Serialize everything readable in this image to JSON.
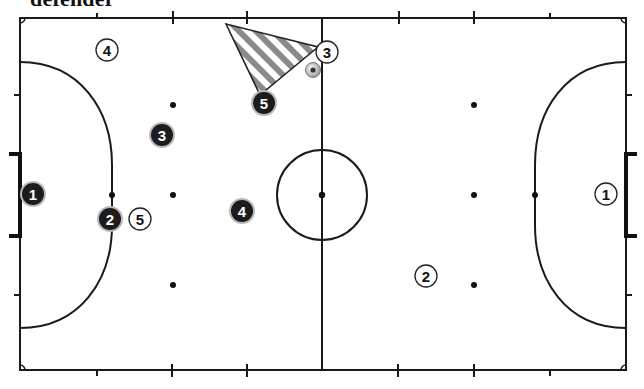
{
  "caption": "defender",
  "field": {
    "left": 20,
    "right": 626,
    "top": 18,
    "bottom": 370,
    "halfway_x": 322,
    "center": {
      "x": 322,
      "y": 195,
      "r": 45
    }
  },
  "colors": {
    "line": "#1a1a1a",
    "dark_team": "#1c1c1c",
    "light_team": "#ffffff",
    "hatch": "#8a8a8a"
  },
  "dark_team": [
    {
      "number": "1",
      "x": 33,
      "y": 194
    },
    {
      "number": "2",
      "x": 110,
      "y": 219
    },
    {
      "number": "3",
      "x": 162,
      "y": 135
    },
    {
      "number": "4",
      "x": 242,
      "y": 211
    },
    {
      "number": "5",
      "x": 264,
      "y": 103
    }
  ],
  "light_team": [
    {
      "number": "4",
      "x": 107,
      "y": 50
    },
    {
      "number": "5",
      "x": 140,
      "y": 219
    },
    {
      "number": "3",
      "x": 327,
      "y": 52
    },
    {
      "number": "2",
      "x": 426,
      "y": 276
    },
    {
      "number": "1",
      "x": 606,
      "y": 194
    }
  ],
  "ball": {
    "x": 313,
    "y": 70
  },
  "zone_triangle": {
    "points": "226,24 318,47 260,95",
    "pattern": "diagonal-hatch"
  }
}
